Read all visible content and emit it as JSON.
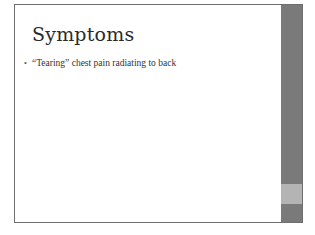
{
  "slide": {
    "title": "Symptoms",
    "bullets": [
      {
        "marker": "•",
        "text": "“Tearing” chest pain radiating to back"
      }
    ]
  },
  "theme": {
    "accent_bar_color": "#7a7a7a",
    "accent_highlight_color": "#b4b4b4",
    "border_color": "#6e6e6e"
  }
}
